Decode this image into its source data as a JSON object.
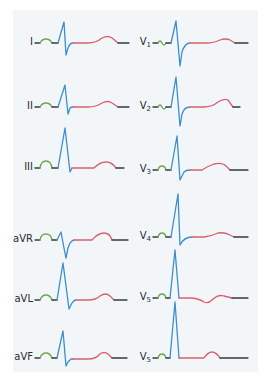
{
  "diagram": {
    "colors": {
      "panel_bg": "#f3f6f8",
      "baseline": "#3a3a3a",
      "p_wave": "#6aa84f",
      "qrs": "#3b8fd0",
      "st_t": "#d9606e"
    },
    "leads_left": [
      {
        "label": "I",
        "y": 43
      },
      {
        "label": "II",
        "y": 107
      },
      {
        "label": "III",
        "y": 168
      },
      {
        "label": "aVR",
        "y": 240
      },
      {
        "label": "aVL",
        "y": 300
      },
      {
        "label": "aVF",
        "y": 358
      }
    ],
    "leads_right": [
      {
        "label": "V",
        "sub": "1",
        "y": 43
      },
      {
        "label": "V",
        "sub": "2",
        "y": 107
      },
      {
        "label": "V",
        "sub": "3",
        "y": 170
      },
      {
        "label": "V",
        "sub": "4",
        "y": 237
      },
      {
        "label": "V",
        "sub": "5",
        "y": 298
      },
      {
        "label": "V",
        "sub": "5",
        "y": 358
      }
    ]
  }
}
